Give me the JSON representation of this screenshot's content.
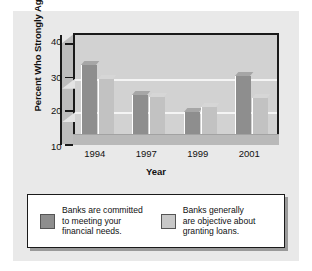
{
  "chart_data": {
    "type": "bar",
    "title": "",
    "xlabel": "Year",
    "ylabel": "Percent Who Strongly Agree",
    "categories": [
      "1994",
      "1997",
      "1999",
      "2001"
    ],
    "ylim": [
      10,
      43
    ],
    "yticks": [
      10,
      20,
      30,
      40
    ],
    "gridlines": [
      20,
      30
    ],
    "grid": true,
    "legend_position": "bottom",
    "series": [
      {
        "name": "Banks are committed\nto meeting your\nfinancial needs.",
        "color": "#8e8e8e",
        "values": [
          33,
          24,
          19,
          29.5
        ]
      },
      {
        "name": "Banks generally\nare objective about\ngranting loans.",
        "color": "#c8c8c8",
        "values": [
          28.8,
          23.5,
          20.5,
          23
        ]
      }
    ]
  },
  "axis": {
    "y_title": "Percent Who Strongly Agree",
    "x_title": "Year",
    "y_tick_labels": [
      "40",
      "30",
      "20",
      "10"
    ],
    "x_tick_labels": [
      "1994",
      "1997",
      "1999",
      "2001"
    ]
  },
  "legend": {
    "entries": [
      {
        "label": "Banks are committed\nto meeting your\nfinancial needs.",
        "swatch": "dark"
      },
      {
        "label": "Banks generally\nare objective about\ngranting loans.",
        "swatch": "light"
      }
    ]
  }
}
